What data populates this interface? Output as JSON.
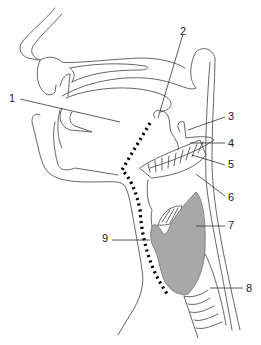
{
  "diagram": {
    "type": "anatomical sagittal section of head and neck (pharynx / larynx)",
    "colors": {
      "outline": "#555555",
      "shaded_region": "#a8a8a8",
      "dotted_path": "#000000",
      "background": "#ffffff"
    },
    "labels": [
      {
        "id": "1",
        "text": "1",
        "x": 9,
        "y": 93
      },
      {
        "id": "2",
        "text": "2",
        "x": 180,
        "y": 26
      },
      {
        "id": "3",
        "text": "3",
        "x": 228,
        "y": 111
      },
      {
        "id": "4",
        "text": "4",
        "x": 228,
        "y": 138
      },
      {
        "id": "5",
        "text": "5",
        "x": 228,
        "y": 159
      },
      {
        "id": "6",
        "text": "6",
        "x": 228,
        "y": 192
      },
      {
        "id": "7",
        "text": "7",
        "x": 228,
        "y": 220
      },
      {
        "id": "8",
        "text": "8",
        "x": 246,
        "y": 283
      },
      {
        "id": "9",
        "text": "9",
        "x": 102,
        "y": 233
      }
    ]
  }
}
